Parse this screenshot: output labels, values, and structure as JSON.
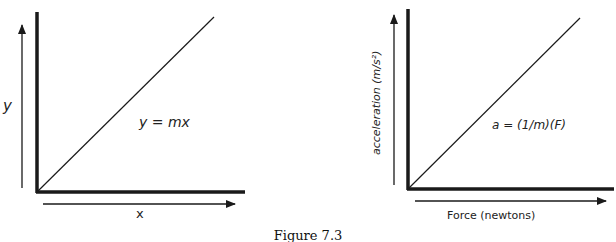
{
  "figure": {
    "caption": "Figure 7.3",
    "panels": [
      {
        "id": "left",
        "y_axis_label": "y",
        "x_axis_label": "x",
        "equation": "y = mx"
      },
      {
        "id": "right",
        "y_axis_label": "acceleration (m/s²)",
        "x_axis_label": "Force (newtons)",
        "equation": "a = (1/m)(F)"
      }
    ]
  },
  "colors": {
    "ink": "#1a1a1a",
    "background": "#ffffff"
  }
}
